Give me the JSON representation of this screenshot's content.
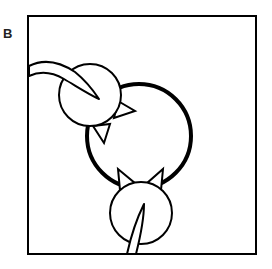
{
  "figure": {
    "panel_label": "B",
    "colors": {
      "stroke": "#000000",
      "fill": "#ffffff",
      "background": "#ffffff"
    },
    "frame": {
      "x": 28,
      "y": 16,
      "width": 228,
      "height": 238
    },
    "central_circle": {
      "cx": 139,
      "cy": 136,
      "r": 52,
      "stroke_width": 4
    },
    "figures": [
      {
        "name": "upper-left-cat-head",
        "cx": 90,
        "cy": 95,
        "r": 31
      },
      {
        "name": "bottom-cat-head",
        "cx": 141,
        "cy": 213,
        "r": 31
      }
    ]
  }
}
